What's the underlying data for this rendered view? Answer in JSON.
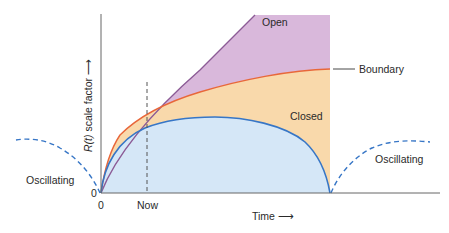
{
  "diagram": {
    "type": "cosmology-scale-factor",
    "axes": {
      "y_label_italic": "R(t)",
      "y_label_rest": " scale factor",
      "y_arrow": "⟶",
      "x_label": "Time",
      "x_arrow": "⟶",
      "origin_y": "0",
      "origin_x": "0",
      "now_tick": "Now"
    },
    "regions": {
      "open": "Open",
      "boundary": "Boundary",
      "closed": "Closed",
      "oscillating_left": "Oscillating",
      "oscillating_right": "Oscillating"
    },
    "colors": {
      "open_fill": "#d9b8db",
      "open_line": "#8c5b96",
      "boundary_fill": "#f9d9ab",
      "boundary_line": "#e8673a",
      "closed_fill": "#d5e7f7",
      "closed_line": "#3776c6",
      "oscillating_dash": "#3776c6",
      "axis": "#555555",
      "now_dash": "#555555"
    }
  }
}
